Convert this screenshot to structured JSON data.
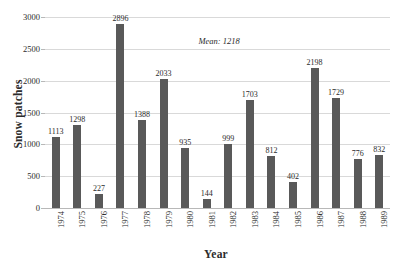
{
  "chart_data": {
    "type": "bar",
    "title": "",
    "xlabel": "Year",
    "ylabel": "Snow patches",
    "categories": [
      "1974",
      "1975",
      "1976",
      "1977",
      "1978",
      "1979",
      "1980",
      "1981",
      "1982",
      "1983",
      "1984",
      "1985",
      "1986",
      "1987",
      "1988",
      "1989"
    ],
    "values": [
      1113,
      1298,
      227,
      2896,
      1388,
      2033,
      935,
      144,
      999,
      1703,
      812,
      402,
      2198,
      1729,
      776,
      832
    ],
    "ylim": [
      0,
      3000
    ],
    "yticks": [
      0,
      500,
      1000,
      1500,
      2000,
      2500,
      3000
    ],
    "ytick_labels": [
      "0",
      "500",
      "1000",
      "1500",
      "2000",
      "2500",
      "3000"
    ],
    "grid": true,
    "legend": "none",
    "bar_color": "#595959",
    "grid_color": "#d9d9d9",
    "annotations": [
      {
        "text": "Mean: 1218",
        "value": 1218,
        "x_pct": 44.5,
        "y_pct": 10.0
      }
    ]
  }
}
